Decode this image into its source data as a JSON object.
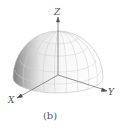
{
  "figure": {
    "caption": "(b)",
    "axes": {
      "x_label": "X",
      "y_label": "Y",
      "z_label": "Z"
    },
    "colors": {
      "shade_dark": "#8a8a8a",
      "shade_light": "#f4f4f4",
      "grid": "#c8c8c8",
      "axis": "#666666",
      "text": "#555555"
    }
  }
}
